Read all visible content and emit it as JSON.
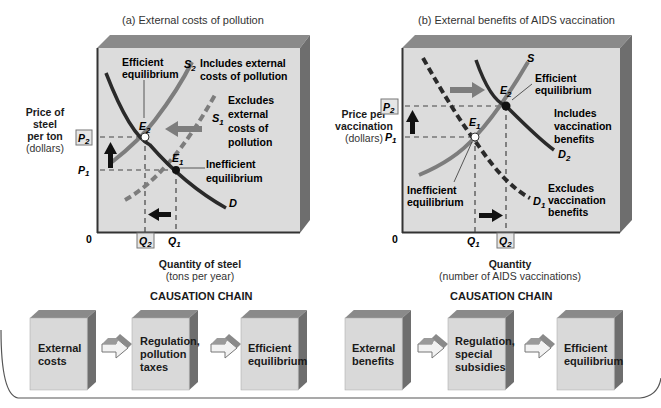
{
  "panel_a": {
    "title": "(a) External costs of pollution",
    "y_label": [
      "Price of",
      "steel",
      "per ton"
    ],
    "y_unit": "(dollars)",
    "x_label": "Quantity of steel",
    "x_unit": "(tons per year)",
    "origin": "0",
    "ticks": {
      "P2": "P",
      "P2_sub": "2",
      "P1": "P",
      "P1_sub": "1",
      "Q2": "Q",
      "Q2_sub": "2",
      "Q1": "Q",
      "Q1_sub": "1"
    },
    "annotations": {
      "efficient": [
        "Efficient",
        "equilibrium"
      ],
      "s2": "S",
      "s2_sub": "2",
      "s2_desc": [
        "Includes external",
        "costs of pollution"
      ],
      "s1": "S",
      "s1_sub": "1",
      "s1_desc": [
        "Excludes",
        "external",
        "costs of",
        "pollution"
      ],
      "e2": "E",
      "e2_sub": "2",
      "e1": "E",
      "e1_sub": "1",
      "inefficient": [
        "Inefficient",
        "equilibrium"
      ],
      "d": "D"
    },
    "chain_title": "CAUSATION CHAIN",
    "chain": [
      [
        "External",
        "costs"
      ],
      [
        "Regulation,",
        "pollution",
        "taxes"
      ],
      [
        "Efficient",
        "equilibrium"
      ]
    ]
  },
  "panel_b": {
    "title": "(b) External benefits of AIDS vaccination",
    "y_label": [
      "Price per",
      "vaccination"
    ],
    "y_unit": "(dollars)",
    "x_label": "Quantity",
    "x_unit": "(number of AIDS vaccinations)",
    "origin": "0",
    "ticks": {
      "P2": "P",
      "P2_sub": "2",
      "P1": "P",
      "P1_sub": "1",
      "Q1": "Q",
      "Q1_sub": "1",
      "Q2": "Q",
      "Q2_sub": "2"
    },
    "annotations": {
      "s": "S",
      "efficient": [
        "Efficient",
        "equilibrium"
      ],
      "e2": "E",
      "e2_sub": "2",
      "e1": "E",
      "e1_sub": "1",
      "d2_desc": [
        "Includes",
        "vaccination",
        "benefits"
      ],
      "d2": "D",
      "d2_sub": "2",
      "inefficient": [
        "Inefficient",
        "equilibrium"
      ],
      "d1": "D",
      "d1_sub": "1",
      "d1_desc": [
        "Excludes",
        "vaccination",
        "benefits"
      ]
    },
    "chain_title": "CAUSATION CHAIN",
    "chain": [
      [
        "External",
        "benefits"
      ],
      [
        "Regulation,",
        "special",
        "subsidies"
      ],
      [
        "Efficient",
        "equilibrium"
      ]
    ]
  },
  "colors": {
    "plot_face": "#dcdcdc",
    "plot_top": "#8a8a8a",
    "plot_side": "#6e6e6e",
    "curve_dark": "#2a2a2a",
    "curve_gray": "#7d7d7d",
    "box_face": "#d9d9d9"
  }
}
